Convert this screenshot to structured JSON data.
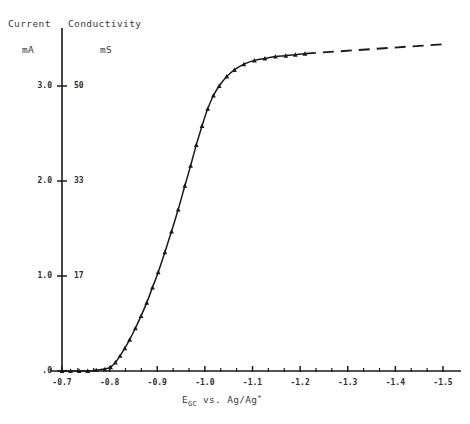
{
  "figure": {
    "background": "#ffffff",
    "ink": "#1a1a1a"
  },
  "headers": {
    "left_quantity": "Current",
    "left_unit": "mA",
    "right_quantity": "Conductivity",
    "right_unit": "mS"
  },
  "axis_title_x": {
    "symbol": "E",
    "subscript": "GC",
    "rest": " vs. Ag/Ag",
    "superscript": "+"
  },
  "chart_data": {
    "type": "line",
    "title": "",
    "xlabel": "E_GC vs. Ag/Ag+",
    "ylabel": "Current / mA (left), Conductivity / mS (right)",
    "grid": false,
    "legend": "none",
    "xlim": [
      -0.7,
      -1.5
    ],
    "x_inverted": true,
    "xticks": [
      -0.7,
      -0.8,
      -0.9,
      -1.0,
      -1.1,
      -1.2,
      -1.3,
      -1.4,
      -1.5
    ],
    "xticklabels": [
      "-0.7",
      "-0.8",
      "-0.9",
      "-1.0",
      "-1.1",
      "-1.2",
      "-1.3",
      "-1.4",
      "-1.5"
    ],
    "x_minor_ticks_per_major": 2,
    "ylim": [
      0.0,
      3.45
    ],
    "yticks_left": [
      0.0,
      1.0,
      2.0,
      3.0
    ],
    "yticklabels_left": [
      ".0",
      "1.0",
      "2.0",
      "3.0"
    ],
    "yticks_right_values": [
      0,
      17,
      33,
      50
    ],
    "yticklabels_right": [
      "",
      "17",
      "33",
      "50"
    ],
    "y_right_mapping": {
      "0.0": 0,
      "1.0": 17,
      "2.0": 33,
      "3.0": 50
    },
    "series": [
      {
        "name": "measured",
        "style": "solid-with-markers",
        "marker": "triangle",
        "x": [
          -0.7,
          -0.718,
          -0.736,
          -0.754,
          -0.772,
          -0.79,
          -0.802,
          -0.812,
          -0.822,
          -0.832,
          -0.842,
          -0.854,
          -0.866,
          -0.878,
          -0.89,
          -0.902,
          -0.916,
          -0.93,
          -0.944,
          -0.958,
          -0.97,
          -0.982,
          -0.994,
          -1.006,
          -1.018,
          -1.03,
          -1.046,
          -1.062,
          -1.082,
          -1.104,
          -1.126,
          -1.148,
          -1.17,
          -1.19,
          -1.21
        ],
        "y": [
          0.0,
          0.0,
          0.0,
          0.0,
          0.01,
          0.02,
          0.04,
          0.09,
          0.16,
          0.24,
          0.33,
          0.45,
          0.58,
          0.72,
          0.88,
          1.04,
          1.25,
          1.47,
          1.7,
          1.95,
          2.16,
          2.38,
          2.58,
          2.76,
          2.9,
          3.0,
          3.1,
          3.17,
          3.23,
          3.27,
          3.29,
          3.31,
          3.32,
          3.33,
          3.34
        ]
      },
      {
        "name": "extrapolated",
        "style": "dashed",
        "marker": "none",
        "x": [
          -1.21,
          -1.5
        ],
        "y": [
          3.34,
          3.44
        ]
      }
    ]
  }
}
